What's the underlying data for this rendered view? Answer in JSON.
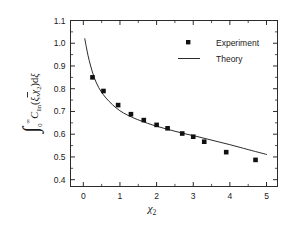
{
  "chart_data": {
    "type": "scatter",
    "title": "",
    "xlabel": "χ₂",
    "ylabel": "∫₀^∞ C̃_lin(ξ,χ₂)dξ",
    "ylabel_parts": {
      "integral": "∫",
      "lower_limit": "0",
      "upper_limit": "∞",
      "function": "C",
      "function_sub": "lin",
      "args": "(ξ,χ",
      "args_sub": "2",
      "args_close": ")dξ"
    },
    "xlim": [
      -0.35,
      5.3
    ],
    "ylim": [
      0.37,
      1.1
    ],
    "xticks": [
      0,
      1,
      2,
      3,
      4,
      5
    ],
    "xticklabels": [
      "0",
      "1",
      "2",
      "3",
      "4",
      "5"
    ],
    "xminorticks": [
      -0.5,
      0.5,
      1.5,
      2.5,
      3.5,
      4.5
    ],
    "yticks": [
      0.4,
      0.5,
      0.6,
      0.7,
      0.8,
      0.9,
      1.0,
      1.1
    ],
    "yticklabels": [
      "0.4",
      "0.5",
      "0.6",
      "0.7",
      "0.8",
      "0.9",
      "1.0",
      "1.1"
    ],
    "grid": false,
    "legend_position": "top-right",
    "series": [
      {
        "name": "Experiment",
        "type": "scatter",
        "marker": "square",
        "color": "#101010",
        "x": [
          0.25,
          0.55,
          0.95,
          1.3,
          1.65,
          2.0,
          2.3,
          2.7,
          3.0,
          3.3,
          3.9,
          4.7
        ],
        "y": [
          0.85,
          0.79,
          0.728,
          0.688,
          0.662,
          0.641,
          0.626,
          0.603,
          0.589,
          0.567,
          0.521,
          0.487
        ]
      },
      {
        "name": "Theory",
        "type": "line",
        "color": "#2b2b2b",
        "x": [
          0.04,
          0.08,
          0.13,
          0.2,
          0.3,
          0.42,
          0.55,
          0.7,
          0.9,
          1.1,
          1.35,
          1.6,
          1.9,
          2.2,
          2.5,
          2.8,
          3.1,
          3.4,
          3.7,
          4.0,
          4.3,
          4.6,
          5.0
        ],
        "y": [
          1.02,
          0.985,
          0.945,
          0.9,
          0.848,
          0.805,
          0.773,
          0.745,
          0.715,
          0.693,
          0.673,
          0.657,
          0.64,
          0.626,
          0.613,
          0.601,
          0.59,
          0.578,
          0.566,
          0.554,
          0.541,
          0.528,
          0.511
        ]
      }
    ],
    "legend": [
      {
        "label": "Experiment",
        "marker": "square"
      },
      {
        "label": "Theory",
        "marker": "line"
      }
    ]
  }
}
